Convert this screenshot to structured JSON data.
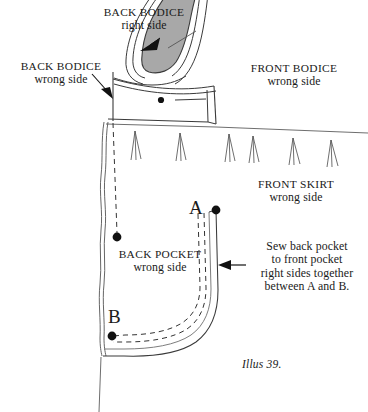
{
  "figure": {
    "caption": "Illus 39.",
    "width": 368,
    "height": 412
  },
  "colors": {
    "ink": "#1a1a1a",
    "line": "#3a3a3a",
    "light_line": "#6e6e6e",
    "shade_fill": "#a8a8a8",
    "paper": "#ffffff"
  },
  "labels": {
    "back_bodice_right": {
      "line1": "BACK BODICE",
      "line2": "right side"
    },
    "back_bodice_wrong": {
      "line1": "BACK BODICE",
      "line2": "wrong side"
    },
    "front_bodice_wrong": {
      "line1": "FRONT BODICE",
      "line2": "wrong side"
    },
    "front_skirt_wrong": {
      "line1": "FRONT SKIRT",
      "line2": "wrong side"
    },
    "back_pocket_wrong": {
      "line1": "BACK POCKET",
      "line2": "wrong side"
    },
    "sew_instruction": {
      "line1": "Sew back pocket",
      "line2": "to front pocket",
      "line3": "right sides together",
      "line4": "between A and B."
    }
  },
  "markers": {
    "point_a": {
      "letter": "A",
      "x": 216,
      "y": 210
    },
    "point_b": {
      "letter": "B",
      "x": 112,
      "y": 336
    },
    "dot_waistband": {
      "x": 161,
      "y": 100
    },
    "dot_pocket_upper": {
      "x": 117,
      "y": 237
    }
  },
  "gathers": {
    "count": 6,
    "x_positions": [
      135,
      180,
      228,
      252,
      292,
      330
    ],
    "top_y": 131,
    "bottom_y": 160
  }
}
